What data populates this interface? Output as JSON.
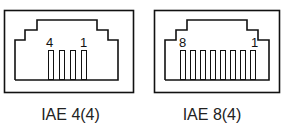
{
  "connectors": [
    {
      "name": "IAE 4(4)",
      "pins": 4,
      "left_pin_label": "4",
      "right_pin_label": "1"
    },
    {
      "name": "IAE 8(4)",
      "pins": 8,
      "left_pin_label": "8",
      "right_pin_label": "1"
    }
  ]
}
